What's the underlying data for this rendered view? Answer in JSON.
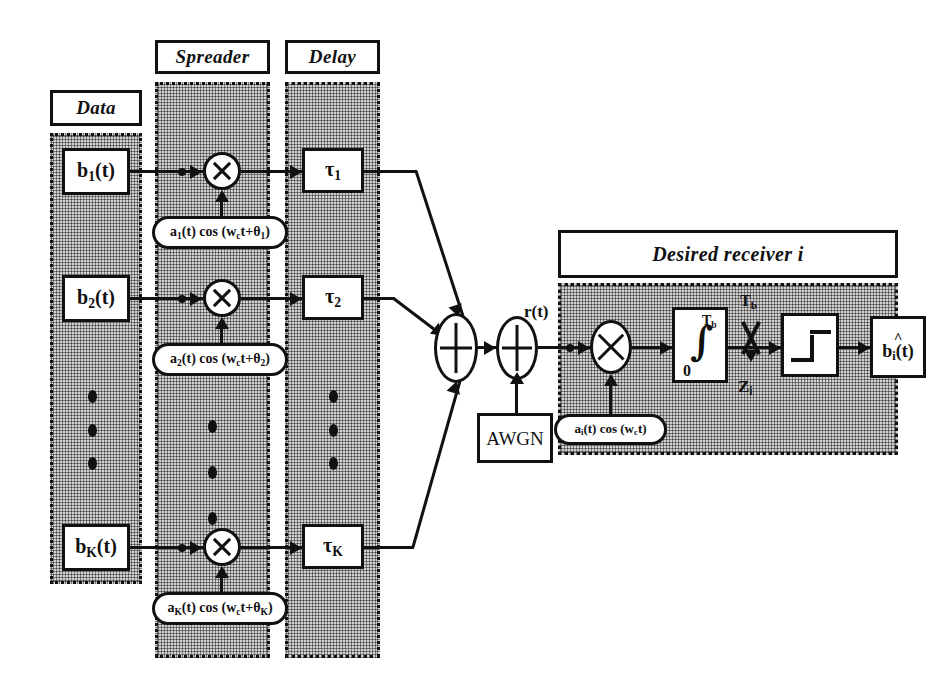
{
  "figure": {
    "type": "block-diagram"
  },
  "headers": {
    "data": "Data",
    "spreader": "Spreader",
    "delay": "Delay",
    "receiver": "Desired receiver  i"
  },
  "users": [
    {
      "data_block": "b₁(t)",
      "data_block_base": "b",
      "data_block_sub": "1",
      "oscillator": "a₁(t) cos (wᴄt+θ₁)",
      "osc_base": "a",
      "osc_sub": "1",
      "delay_base": "τ",
      "delay_sub": "1"
    },
    {
      "data_block": "b₂(t)",
      "data_block_base": "b",
      "data_block_sub": "2",
      "oscillator": "a₂(t) cos (wᴄt+θ₂)",
      "osc_base": "a",
      "osc_sub": "2",
      "delay_base": "τ",
      "delay_sub": "2"
    },
    {
      "data_block": "bₖ(t)",
      "data_block_base": "b",
      "data_block_sub": "K",
      "oscillator": "aₖ(t) cos (wᴄt+θₖ)",
      "osc_base": "a",
      "osc_sub": "K",
      "delay_base": "τ",
      "delay_sub": "K"
    }
  ],
  "channel": {
    "noise_source": "AWGN",
    "received_signal": "r(t)",
    "sum_symbol": "+"
  },
  "receiver": {
    "local_oscillator": "aᵢ(t) cos (wᴄt)",
    "lo_base": "a",
    "lo_sub": "i",
    "integrator_upper_limit": "Tᵇ",
    "integrator_lower_limit": "0",
    "integrator_symbol": "∫",
    "sampler_label": "Tᵇ",
    "decision_variable": "Zᵢ",
    "decision_variable_base": "Z",
    "decision_variable_sub": "i",
    "output_hat": "^",
    "output_base": "b",
    "output_sub": "i",
    "output_tail": "(t)",
    "output": "b̂ᵢ(t)"
  },
  "ellipsis": {
    "glyph": "•••"
  },
  "colors": {
    "ink": "#111111",
    "panel_fill": "#d2d2d2",
    "background": "#ffffff"
  }
}
